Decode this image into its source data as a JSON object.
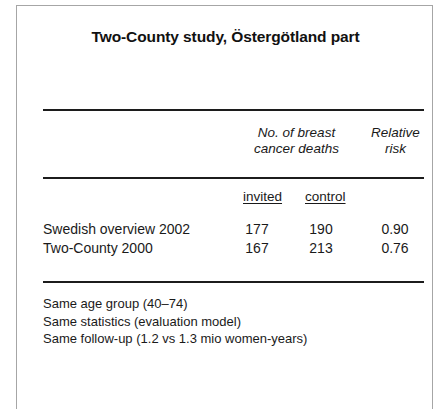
{
  "figure": {
    "title": "Two-County study, Östergötland part",
    "table": {
      "group_headers": [
        {
          "line1": "No. of breast",
          "line2": "cancer deaths"
        },
        {
          "line1": "Relative",
          "line2": "risk"
        }
      ],
      "sub_headers": [
        "invited",
        "control"
      ],
      "rows": [
        {
          "label": "Swedish overview 2002",
          "invited": "177",
          "control": "190",
          "relative_risk": "0.90"
        },
        {
          "label": "Two-County 2000",
          "invited": "167",
          "control": "213",
          "relative_risk": "0.76"
        }
      ]
    },
    "notes": [
      "Same age group (40–74)",
      "Same statistics (evaluation model)",
      "Same follow-up (1.2 vs 1.3 mio women-years)"
    ]
  }
}
